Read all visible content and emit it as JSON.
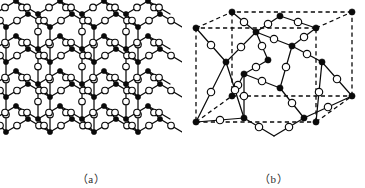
{
  "figure": {
    "background_color": "#ffffff",
    "line_color": "#0a0a0a",
    "panels": [
      {
        "id": "a",
        "caption": "（a）",
        "description": "extended-lattice-network",
        "atom_types": [
          {
            "name": "filled-atom",
            "style": "filled-black-dot",
            "color": "#0a0a0a"
          },
          {
            "name": "open-atom",
            "style": "open-white-circle",
            "color": "#ffffff"
          }
        ],
        "bond_style": "solid"
      },
      {
        "id": "b",
        "caption": "（b）",
        "description": "cubic-unit-cell",
        "atom_types": [
          {
            "name": "filled-atom",
            "style": "filled-black-dot",
            "color": "#0a0a0a"
          },
          {
            "name": "open-atom",
            "style": "open-white-circle",
            "color": "#ffffff"
          }
        ],
        "bond_style": "solid",
        "cell_outline_style": "dashed"
      }
    ]
  },
  "structure_a": {
    "type": "network",
    "filled_radius": 2.6,
    "open_radius": 3.3,
    "filled_atoms": [
      [
        24,
        27
      ],
      [
        68,
        14
      ],
      [
        112,
        27
      ],
      [
        156,
        14
      ],
      [
        24,
        62
      ],
      [
        68,
        49
      ],
      [
        112,
        62
      ],
      [
        156,
        49
      ],
      [
        24,
        97
      ],
      [
        68,
        84
      ],
      [
        112,
        97
      ],
      [
        156,
        84
      ],
      [
        46,
        45
      ],
      [
        90,
        32
      ],
      [
        134,
        45
      ],
      [
        170,
        32
      ],
      [
        46,
        80
      ],
      [
        90,
        67
      ],
      [
        134,
        80
      ],
      [
        170,
        67
      ],
      [
        46,
        115
      ],
      [
        90,
        102
      ],
      [
        134,
        115
      ],
      [
        170,
        102
      ],
      [
        12,
        44
      ],
      [
        56,
        31
      ],
      [
        100,
        44
      ],
      [
        144,
        31
      ],
      [
        12,
        79
      ],
      [
        56,
        66
      ],
      [
        100,
        79
      ],
      [
        144,
        66
      ],
      [
        12,
        114
      ],
      [
        56,
        101
      ],
      [
        100,
        114
      ],
      [
        144,
        101
      ],
      [
        24,
        132
      ],
      [
        68,
        119
      ],
      [
        112,
        132
      ],
      [
        156,
        119
      ],
      [
        46,
        150
      ],
      [
        90,
        137
      ],
      [
        134,
        150
      ],
      [
        170,
        137
      ],
      [
        12,
        149
      ],
      [
        56,
        136
      ],
      [
        100,
        149
      ],
      [
        144,
        136
      ],
      [
        34,
        155
      ],
      [
        78,
        142
      ],
      [
        122,
        155
      ],
      [
        166,
        142
      ]
    ],
    "open_atoms": [
      [
        46,
        20
      ],
      [
        90,
        7
      ],
      [
        134,
        20
      ],
      [
        14,
        35
      ],
      [
        58,
        22
      ],
      [
        102,
        35
      ],
      [
        146,
        22
      ],
      [
        35,
        36
      ],
      [
        79,
        23
      ],
      [
        123,
        36
      ],
      [
        167,
        23
      ],
      [
        24,
        44
      ],
      [
        68,
        31
      ],
      [
        112,
        44
      ],
      [
        156,
        31
      ],
      [
        46,
        55
      ],
      [
        90,
        42
      ],
      [
        134,
        55
      ],
      [
        170,
        42
      ],
      [
        14,
        70
      ],
      [
        58,
        57
      ],
      [
        102,
        70
      ],
      [
        146,
        57
      ],
      [
        35,
        71
      ],
      [
        79,
        58
      ],
      [
        123,
        71
      ],
      [
        167,
        58
      ],
      [
        24,
        79
      ],
      [
        68,
        66
      ],
      [
        112,
        79
      ],
      [
        156,
        66
      ],
      [
        46,
        90
      ],
      [
        90,
        77
      ],
      [
        134,
        90
      ],
      [
        170,
        77
      ],
      [
        14,
        105
      ],
      [
        58,
        92
      ],
      [
        102,
        105
      ],
      [
        146,
        92
      ],
      [
        35,
        106
      ],
      [
        79,
        93
      ],
      [
        123,
        106
      ],
      [
        167,
        93
      ],
      [
        24,
        114
      ],
      [
        68,
        101
      ],
      [
        112,
        114
      ],
      [
        156,
        101
      ],
      [
        46,
        125
      ],
      [
        90,
        112
      ],
      [
        134,
        125
      ],
      [
        170,
        112
      ],
      [
        14,
        140
      ],
      [
        58,
        127
      ],
      [
        102,
        140
      ],
      [
        146,
        127
      ],
      [
        35,
        141
      ],
      [
        79,
        128
      ],
      [
        123,
        141
      ],
      [
        167,
        128
      ],
      [
        24,
        149
      ],
      [
        68,
        136
      ],
      [
        112,
        149
      ],
      [
        156,
        136
      ],
      [
        46,
        158
      ],
      [
        90,
        145
      ],
      [
        134,
        158
      ]
    ]
  },
  "structure_b": {
    "type": "unit-cell",
    "filled_radius": 3.1,
    "open_radius": 3.7,
    "cube_vertices_front": [
      [
        14,
        122
      ],
      [
        134,
        122
      ],
      [
        134,
        28
      ],
      [
        14,
        28
      ]
    ],
    "cube_vertices_back": [
      [
        50,
        96
      ],
      [
        170,
        96
      ],
      [
        170,
        12
      ],
      [
        50,
        12
      ]
    ],
    "filled_atoms": [
      [
        14,
        122
      ],
      [
        134,
        122
      ],
      [
        14,
        28
      ],
      [
        134,
        28
      ],
      [
        50,
        96
      ],
      [
        170,
        96
      ],
      [
        50,
        12
      ],
      [
        170,
        12
      ],
      [
        74,
        32
      ],
      [
        110,
        46
      ],
      [
        62,
        74
      ],
      [
        98,
        88
      ],
      [
        44,
        62
      ],
      [
        140,
        62
      ],
      [
        86,
        60
      ],
      [
        62,
        118
      ],
      [
        122,
        118
      ],
      [
        98,
        16
      ]
    ],
    "open_atoms": [
      [
        62,
        22
      ],
      [
        86,
        24
      ],
      [
        98,
        38
      ],
      [
        122,
        36
      ],
      [
        56,
        50
      ],
      [
        74,
        52
      ],
      [
        110,
        62
      ],
      [
        128,
        58
      ],
      [
        38,
        72
      ],
      [
        146,
        74
      ],
      [
        74,
        84
      ],
      [
        86,
        76
      ],
      [
        50,
        104
      ],
      [
        110,
        104
      ],
      [
        68,
        106
      ],
      [
        116,
        94
      ],
      [
        92,
        120
      ],
      [
        80,
        112
      ],
      [
        104,
        116
      ],
      [
        152,
        84
      ],
      [
        32,
        50
      ]
    ]
  }
}
